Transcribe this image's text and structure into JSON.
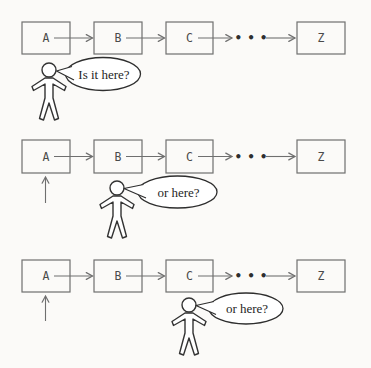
{
  "diagram": {
    "ellipsis": "•••",
    "rows": [
      {
        "nodes": [
          "A",
          "B",
          "C",
          "Z"
        ],
        "question": "Is it here?"
      },
      {
        "nodes": [
          "A",
          "B",
          "C",
          "Z"
        ],
        "question": "or here?"
      },
      {
        "nodes": [
          "A",
          "B",
          "C",
          "Z"
        ],
        "question": "or here?"
      }
    ],
    "colors": {
      "background": "#fbfaf8",
      "box_border": "#6f6f6f",
      "arrow": "#6f6f6f",
      "node_text": "#4a4a4a",
      "dots": "#2e2e2e",
      "figure_stroke": "#333333",
      "bubble_stroke": "#2e2e2e",
      "bubble_text": "#1f1f1f"
    }
  }
}
